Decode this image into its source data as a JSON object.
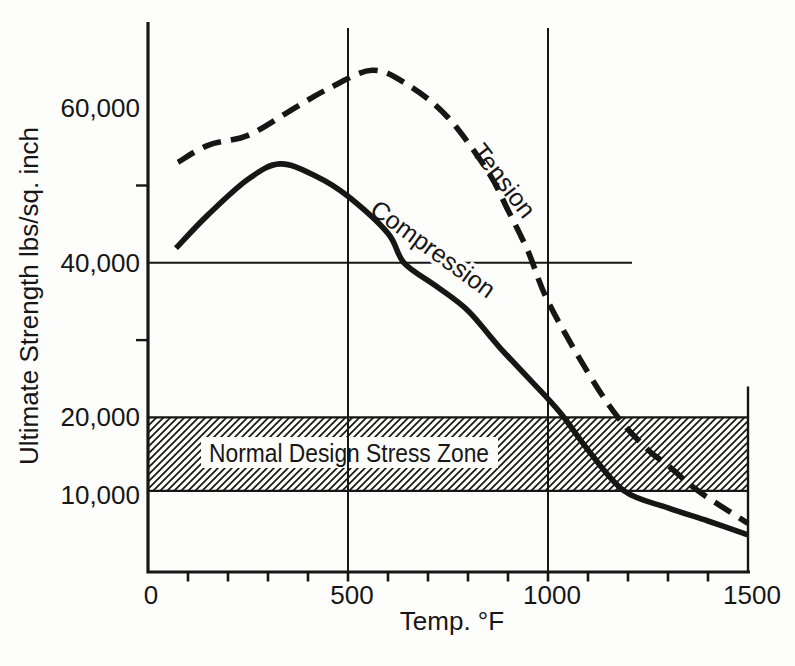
{
  "figure": {
    "background_color": "#fdfdfc",
    "ink_color": "#161616"
  },
  "chart_data": {
    "type": "line",
    "title": "",
    "xlabel": "Temp. °F",
    "ylabel": "Ultimate Strength lbs/sq. inch",
    "xlim": [
      0,
      1500
    ],
    "ylim": [
      0,
      71000
    ],
    "grid": "partial-crosshair",
    "legend_position": "labels-on-curves",
    "x_major_ticks": [
      {
        "value": 0,
        "label": "0"
      },
      {
        "value": 500,
        "label": "500"
      },
      {
        "value": 1000,
        "label": "1000"
      },
      {
        "value": 1500,
        "label": "1500"
      }
    ],
    "x_minor_tick_step": 100,
    "y_labeled_ticks": [
      {
        "value": 10000,
        "label": "10,000"
      },
      {
        "value": 20000,
        "label": "20,000"
      },
      {
        "value": 40000,
        "label": "40,000"
      },
      {
        "value": 60000,
        "label": "60,000"
      }
    ],
    "y_unlabeled_ticks": [
      30000,
      50000
    ],
    "gridlines": {
      "vertical_x": [
        500,
        1000
      ],
      "horizontal_y": 40000,
      "horizontal_line_x_extent": [
        0,
        1210
      ],
      "right_border_x": 1500,
      "right_border_y_extent": [
        0,
        24000
      ]
    },
    "band": {
      "label": "Normal Design Stress Zone",
      "y_from": 10500,
      "y_to": 20000,
      "x_from": 0,
      "x_to": 1500,
      "style": "diagonal-hatch"
    },
    "series": [
      {
        "name": "Tension",
        "style": "dashed",
        "points": [
          [
            75,
            53000
          ],
          [
            150,
            55200
          ],
          [
            250,
            56500
          ],
          [
            350,
            59500
          ],
          [
            450,
            62500
          ],
          [
            560,
            64900
          ],
          [
            650,
            63000
          ],
          [
            750,
            58800
          ],
          [
            850,
            51800
          ],
          [
            900,
            46800
          ],
          [
            950,
            41500
          ],
          [
            1000,
            35000
          ],
          [
            1100,
            25800
          ],
          [
            1175,
            20000
          ],
          [
            1250,
            15800
          ],
          [
            1300,
            13800
          ],
          [
            1375,
            10500
          ],
          [
            1500,
            6300
          ]
        ]
      },
      {
        "name": "Compression",
        "style": "solid",
        "points": [
          [
            70,
            41900
          ],
          [
            150,
            46200
          ],
          [
            250,
            50800
          ],
          [
            330,
            52800
          ],
          [
            420,
            51200
          ],
          [
            500,
            48600
          ],
          [
            600,
            43800
          ],
          [
            640,
            40000
          ],
          [
            720,
            37000
          ],
          [
            800,
            33800
          ],
          [
            880,
            29000
          ],
          [
            1000,
            22400
          ],
          [
            1040,
            20000
          ],
          [
            1100,
            15800
          ],
          [
            1190,
            10500
          ],
          [
            1300,
            8300
          ],
          [
            1400,
            6600
          ],
          [
            1500,
            4800
          ]
        ]
      }
    ]
  }
}
